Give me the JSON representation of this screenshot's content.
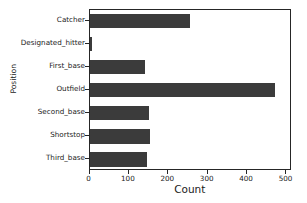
{
  "chart_data": {
    "type": "bar",
    "orientation": "horizontal",
    "title": "",
    "xlabel": "Count",
    "ylabel": "Position",
    "categories": [
      "Catcher",
      "Designated_hitter",
      "First_base",
      "Outfield",
      "Second_base",
      "Shortstop",
      "Third_base"
    ],
    "values": [
      254,
      7,
      140,
      471,
      151,
      154,
      147
    ],
    "xlim": [
      0,
      514
    ],
    "xticks": [
      0,
      100,
      200,
      300,
      400,
      500
    ],
    "xtick_labels": [
      "0",
      "100",
      "200",
      "300",
      "400",
      "500"
    ],
    "grid": false,
    "legend": null,
    "bar_color": "#3b3b3b",
    "axis_color": "#262626",
    "background_color": "#ffffff"
  },
  "axes": {
    "x_axis_label": "Count",
    "y_axis_label": "Position"
  }
}
